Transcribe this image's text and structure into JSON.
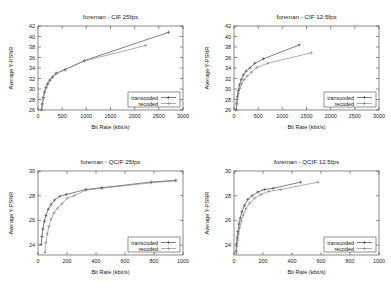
{
  "figure": {
    "name": "rate-distortion-comparison",
    "series_names": [
      "transcoded",
      "recoded"
    ]
  },
  "legend": {
    "transcoded": "transcoded",
    "recoded": "recoded"
  },
  "chart_data": [
    {
      "type": "line",
      "panel": "top-left",
      "title": "foreman - CIF  25fps",
      "xlabel": "Bit Rate (kbit/s)",
      "ylabel": "Average Y-PSNR",
      "xlim": [
        0,
        3000
      ],
      "ylim": [
        26,
        42
      ],
      "xticks": [
        0,
        500,
        1000,
        1500,
        2000,
        2500,
        3000
      ],
      "yticks": [
        26,
        28,
        30,
        32,
        34,
        36,
        38,
        40,
        42
      ],
      "grid": false,
      "legend_position": "lower-right",
      "series": [
        {
          "name": "transcoded",
          "x": [
            75,
            90,
            110,
            135,
            165,
            200,
            245,
            300,
            375,
            560,
            960,
            2700
          ],
          "y": [
            26.1,
            27.2,
            28.4,
            29.4,
            30.3,
            31.0,
            31.7,
            32.3,
            33.0,
            33.7,
            35.4,
            40.8
          ]
        },
        {
          "name": "recoded",
          "x": [
            75,
            90,
            110,
            135,
            165,
            200,
            245,
            300,
            375,
            560,
            960,
            2230
          ],
          "y": [
            26.05,
            27.1,
            28.3,
            29.3,
            30.2,
            30.9,
            31.6,
            32.2,
            32.9,
            33.65,
            35.35,
            38.3
          ]
        }
      ]
    },
    {
      "type": "line",
      "panel": "top-right",
      "title": "foreman - CIF  12.5fps",
      "xlabel": "Bit Rate (kbit/s)",
      "ylabel": "Average Y-PSNR",
      "xlim": [
        0,
        3000
      ],
      "ylim": [
        26,
        42
      ],
      "xticks": [
        0,
        500,
        1000,
        1500,
        2000,
        2500,
        3000
      ],
      "yticks": [
        26,
        28,
        30,
        32,
        34,
        36,
        38,
        40,
        42
      ],
      "grid": false,
      "legend_position": "lower-right",
      "series": [
        {
          "name": "transcoded",
          "x": [
            45,
            55,
            70,
            90,
            115,
            150,
            195,
            250,
            330,
            430,
            610,
            1350
          ],
          "y": [
            26.1,
            27.3,
            28.6,
            29.7,
            30.8,
            31.8,
            32.7,
            33.4,
            34.0,
            34.9,
            35.75,
            38.4
          ]
        },
        {
          "name": "recoded",
          "x": [
            45,
            55,
            70,
            90,
            120,
            160,
            210,
            275,
            360,
            470,
            700,
            1600
          ],
          "y": [
            26.0,
            27.0,
            28.1,
            29.1,
            30.1,
            31.0,
            31.8,
            32.5,
            33.2,
            34.1,
            34.9,
            36.9
          ]
        }
      ]
    },
    {
      "type": "line",
      "panel": "bottom-left",
      "title": "foreman - QCIF  25fps",
      "xlabel": "Bit Rate (kbit/s)",
      "ylabel": "Average Y-PSNR",
      "xlim": [
        0,
        1000
      ],
      "ylim": [
        23.2,
        30
      ],
      "xticks": [
        0,
        200,
        400,
        600,
        800,
        1000
      ],
      "yticks": [
        24,
        26,
        28,
        30
      ],
      "grid": false,
      "legend_position": "lower-right",
      "series": [
        {
          "name": "transcoded",
          "x": [
            22,
            27,
            34,
            43,
            55,
            70,
            90,
            115,
            150,
            195,
            330,
            440,
            780,
            950
          ],
          "y": [
            24.05,
            24.7,
            25.3,
            25.9,
            26.4,
            26.9,
            27.3,
            27.65,
            27.95,
            28.1,
            28.5,
            28.65,
            29.1,
            29.25
          ]
        },
        {
          "name": "recoded",
          "x": [
            48,
            55,
            64,
            75,
            90,
            110,
            135,
            165,
            200,
            250,
            330,
            440,
            780,
            950
          ],
          "y": [
            23.4,
            24.2,
            24.9,
            25.5,
            26.1,
            26.6,
            27.0,
            27.35,
            27.8,
            28.0,
            28.45,
            28.6,
            29.05,
            29.2
          ]
        }
      ]
    },
    {
      "type": "line",
      "panel": "bottom-right",
      "title": "foreman - QCIF  12.5fps",
      "xlabel": "Bit Rate (kbit/s)",
      "ylabel": "Average Y-PSNR",
      "xlim": [
        0,
        1000
      ],
      "ylim": [
        23.2,
        30
      ],
      "xticks": [
        0,
        200,
        400,
        600,
        800,
        1000
      ],
      "yticks": [
        24,
        26,
        28,
        30
      ],
      "grid": false,
      "legend_position": "lower-right",
      "series": [
        {
          "name": "transcoded",
          "x": [
            15,
            18,
            22,
            27,
            34,
            43,
            55,
            72,
            95,
            125,
            165,
            210,
            270,
            460
          ],
          "y": [
            23.5,
            24.1,
            24.6,
            25.1,
            25.7,
            26.2,
            26.7,
            27.2,
            27.7,
            28.0,
            28.3,
            28.5,
            28.6,
            29.1
          ]
        },
        {
          "name": "recoded",
          "x": [
            16,
            20,
            25,
            31,
            39,
            50,
            64,
            82,
            108,
            142,
            185,
            240,
            320,
            580
          ],
          "y": [
            23.35,
            23.9,
            24.4,
            24.9,
            25.4,
            25.95,
            26.45,
            26.95,
            27.4,
            27.8,
            28.1,
            28.35,
            28.5,
            29.1
          ]
        }
      ]
    }
  ]
}
